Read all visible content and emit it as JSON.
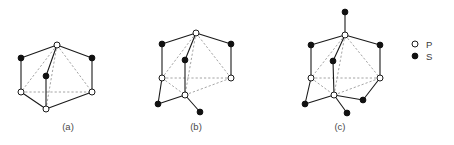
{
  "figure": {
    "background_color": "#ffffff",
    "solid_edge_color": "#1a1a1a",
    "dashed_edge_color": "#9a9a9a",
    "atom_p_fill": "#ffffff",
    "atom_p_stroke": "#1a1a1a",
    "atom_s_fill": "#111111",
    "atom_radius_p": 3.0,
    "atom_radius_s": 2.9
  },
  "legend": {
    "name": "atom-type-legend",
    "entries": [
      {
        "symbol": "P",
        "marker": "open-circle",
        "color": "#ffffff"
      },
      {
        "symbol": "S",
        "marker": "filled-circle",
        "color": "#111111"
      }
    ],
    "marker_x": 415,
    "label_x": 426,
    "rows_y": [
      44,
      56
    ]
  },
  "panels": [
    {
      "id": "a",
      "label": "(a)",
      "label_x": 68,
      "label_y": 130,
      "atoms": [
        {
          "name": "p-apex-top",
          "type": "P",
          "x": 57,
          "y": 45
        },
        {
          "name": "s-upper-left",
          "type": "S",
          "x": 21,
          "y": 58
        },
        {
          "name": "s-upper-right",
          "type": "S",
          "x": 92,
          "y": 58
        },
        {
          "name": "s-center",
          "type": "S",
          "x": 46,
          "y": 76
        },
        {
          "name": "p-mid-left",
          "type": "P",
          "x": 21,
          "y": 92
        },
        {
          "name": "p-mid-right",
          "type": "P",
          "x": 92,
          "y": 92
        },
        {
          "name": "p-bottom",
          "type": "P",
          "x": 46,
          "y": 109
        }
      ],
      "solid_edges": [
        [
          "s-upper-left",
          "p-apex-top"
        ],
        [
          "p-apex-top",
          "s-upper-right"
        ],
        [
          "s-upper-left",
          "p-mid-left"
        ],
        [
          "s-upper-right",
          "p-mid-right"
        ],
        [
          "p-apex-top",
          "s-center"
        ],
        [
          "s-center",
          "p-bottom"
        ],
        [
          "p-mid-left",
          "p-bottom"
        ],
        [
          "p-bottom",
          "p-mid-right"
        ]
      ],
      "dashed_edges": [
        [
          "p-apex-top",
          "p-mid-left"
        ],
        [
          "p-apex-top",
          "p-mid-right"
        ],
        [
          "p-apex-top",
          "p-bottom"
        ],
        [
          "p-mid-left",
          "p-mid-right"
        ]
      ]
    },
    {
      "id": "b",
      "label": "(b)",
      "label_x": 196,
      "label_y": 130,
      "atoms": [
        {
          "name": "p-apex-top",
          "type": "P",
          "x": 196,
          "y": 33
        },
        {
          "name": "s-upper-left",
          "type": "S",
          "x": 162,
          "y": 44
        },
        {
          "name": "s-upper-right",
          "type": "S",
          "x": 231,
          "y": 44
        },
        {
          "name": "s-center",
          "type": "S",
          "x": 185,
          "y": 60
        },
        {
          "name": "p-mid-left",
          "type": "P",
          "x": 162,
          "y": 78
        },
        {
          "name": "p-mid-right",
          "type": "P",
          "x": 231,
          "y": 78
        },
        {
          "name": "p-bottom",
          "type": "P",
          "x": 185,
          "y": 95
        },
        {
          "name": "s-lower-left",
          "type": "S",
          "x": 158,
          "y": 104
        },
        {
          "name": "s-lower-right",
          "type": "S",
          "x": 200,
          "y": 112
        }
      ],
      "solid_edges": [
        [
          "s-upper-left",
          "p-apex-top"
        ],
        [
          "p-apex-top",
          "s-upper-right"
        ],
        [
          "s-upper-left",
          "p-mid-left"
        ],
        [
          "s-upper-right",
          "p-mid-right"
        ],
        [
          "p-apex-top",
          "s-center"
        ],
        [
          "s-center",
          "p-bottom"
        ],
        [
          "p-mid-left",
          "s-lower-left"
        ],
        [
          "s-lower-left",
          "p-bottom"
        ],
        [
          "p-bottom",
          "s-lower-right"
        ]
      ],
      "dashed_edges": [
        [
          "p-apex-top",
          "p-mid-left"
        ],
        [
          "p-apex-top",
          "p-mid-right"
        ],
        [
          "p-apex-top",
          "p-bottom"
        ],
        [
          "p-mid-left",
          "p-mid-right"
        ],
        [
          "p-mid-left",
          "p-bottom"
        ],
        [
          "p-bottom",
          "p-mid-right"
        ]
      ]
    },
    {
      "id": "c",
      "label": "(c)",
      "label_x": 340,
      "label_y": 130,
      "atoms": [
        {
          "name": "s-top-cap",
          "type": "S",
          "x": 345,
          "y": 12
        },
        {
          "name": "p-apex-top",
          "type": "P",
          "x": 345,
          "y": 35
        },
        {
          "name": "s-upper-left",
          "type": "S",
          "x": 311,
          "y": 45
        },
        {
          "name": "s-upper-right",
          "type": "S",
          "x": 380,
          "y": 45
        },
        {
          "name": "s-center",
          "type": "S",
          "x": 333,
          "y": 61
        },
        {
          "name": "p-mid-left",
          "type": "P",
          "x": 311,
          "y": 78
        },
        {
          "name": "p-mid-right",
          "type": "P",
          "x": 380,
          "y": 78
        },
        {
          "name": "p-bottom",
          "type": "P",
          "x": 334,
          "y": 95
        },
        {
          "name": "s-lower-left",
          "type": "S",
          "x": 305,
          "y": 104
        },
        {
          "name": "s-lower-right",
          "type": "S",
          "x": 363,
          "y": 100
        },
        {
          "name": "s-bottom-cap",
          "type": "S",
          "x": 347,
          "y": 113
        }
      ],
      "solid_edges": [
        [
          "s-top-cap",
          "p-apex-top"
        ],
        [
          "s-upper-left",
          "p-apex-top"
        ],
        [
          "p-apex-top",
          "s-upper-right"
        ],
        [
          "s-upper-left",
          "p-mid-left"
        ],
        [
          "s-upper-right",
          "p-mid-right"
        ],
        [
          "p-apex-top",
          "s-center"
        ],
        [
          "s-center",
          "p-bottom"
        ],
        [
          "p-mid-left",
          "s-lower-left"
        ],
        [
          "s-lower-left",
          "p-bottom"
        ],
        [
          "p-bottom",
          "s-bottom-cap"
        ],
        [
          "p-bottom",
          "s-lower-right"
        ],
        [
          "s-lower-right",
          "p-mid-right"
        ]
      ],
      "dashed_edges": [
        [
          "p-apex-top",
          "p-mid-left"
        ],
        [
          "p-apex-top",
          "p-mid-right"
        ],
        [
          "p-apex-top",
          "p-bottom"
        ],
        [
          "p-mid-left",
          "p-mid-right"
        ],
        [
          "p-mid-left",
          "p-bottom"
        ],
        [
          "p-bottom",
          "p-mid-right"
        ]
      ]
    }
  ]
}
